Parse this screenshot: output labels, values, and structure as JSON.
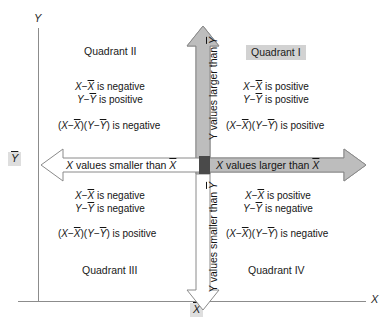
{
  "page": {
    "header_left": "",
    "header_right": ""
  },
  "axes": {
    "x_label": "X",
    "y_label": "Y",
    "x_mean": "X",
    "y_mean": "Y"
  },
  "arrows": {
    "x_left_var": "X",
    "x_left_text": "values smaller than",
    "x_right_var": "X",
    "x_right_text": "values larger than",
    "y_up": "Y values larger than Y",
    "y_down": "Y values smaller than Y"
  },
  "quadrants": [
    {
      "name": "Quadrant I",
      "position": "top-right",
      "highlighted": true,
      "x_cond": "is positive",
      "y_cond": "is positive",
      "product": "is positive"
    },
    {
      "name": "Quadrant II",
      "position": "top-left",
      "highlighted": false,
      "x_cond": "is negative",
      "y_cond": "is positive",
      "product": "is negative"
    },
    {
      "name": "Quadrant III",
      "position": "bottom-left",
      "highlighted": false,
      "x_cond": "is negative",
      "y_cond": "is negative",
      "product": "is positive"
    },
    {
      "name": "Quadrant IV",
      "position": "bottom-right",
      "highlighted": false,
      "x_cond": "is positive",
      "y_cond": "is negative",
      "product": "is negative"
    }
  ],
  "colors": {
    "arrow_fill_shaded": "#bdbdbd",
    "arrow_fill_plain": "#ffffff",
    "arrow_stroke": "#8a8a8a",
    "axis": "#8c8c8c",
    "highlight": "#d2d2d2",
    "intersection": "#4a4a4a",
    "text": "#141414"
  }
}
